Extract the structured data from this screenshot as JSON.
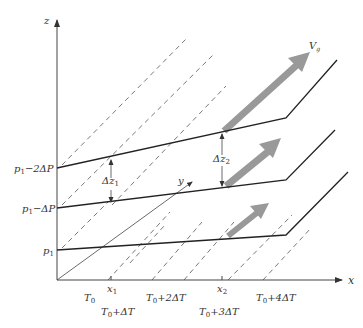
{
  "diagram": {
    "axes": {
      "z_label": "z",
      "x_label": "x",
      "y_label": "y"
    },
    "isobars": [
      {
        "label": "p₁",
        "base": "p",
        "sub": "1",
        "suffix": ""
      },
      {
        "label": "p₁−ΔP",
        "base": "p",
        "sub": "1",
        "suffix": "−ΔP"
      },
      {
        "label": "p₁−2ΔP",
        "base": "p",
        "sub": "1",
        "suffix": "−2ΔP"
      }
    ],
    "thickness": [
      {
        "label": "Δz₁",
        "base": "Δz",
        "sub": "1"
      },
      {
        "label": "Δz₂",
        "base": "Δz",
        "sub": "2"
      }
    ],
    "positions": [
      {
        "label": "x₁",
        "base": "x",
        "sub": "1"
      },
      {
        "label": "x₂",
        "base": "x",
        "sub": "2"
      }
    ],
    "isotherms": [
      {
        "label": "T₀",
        "base": "T",
        "sub": "0",
        "suffix": ""
      },
      {
        "label": "T₀+ΔT",
        "base": "T",
        "sub": "0",
        "suffix": "+ΔT"
      },
      {
        "label": "T₀+2ΔT",
        "base": "T",
        "sub": "0",
        "suffix": "+2ΔT"
      },
      {
        "label": "T₀+3ΔT",
        "base": "T",
        "sub": "0",
        "suffix": "+3ΔT"
      },
      {
        "label": "T₀+4ΔT",
        "base": "T",
        "sub": "0",
        "suffix": "+4ΔT"
      }
    ],
    "wind": {
      "label": "V_g",
      "base": "V",
      "sub": "g"
    },
    "colors": {
      "wind_arrow": "#999999",
      "lines": "#222222",
      "dashed": "#555555"
    }
  }
}
